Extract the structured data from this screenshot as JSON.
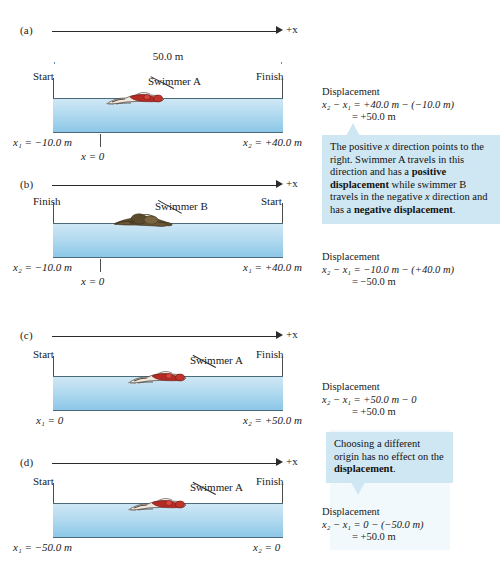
{
  "figure": {
    "axis_label": "+x",
    "distance_label": "50.0 m",
    "origin_label": "x = 0"
  },
  "panels": [
    {
      "id": "a",
      "label": "(a)",
      "axis_label": "+x",
      "dimension": "50.0 m",
      "left_end": "Start",
      "right_end": "Finish",
      "swimmer": "Swimmer A",
      "swimmer_color": "#b42a24",
      "left_coord": "x₁ = −10.0 m",
      "right_coord": "x₂ = +40.0 m",
      "origin_label": "x = 0",
      "has_origin_tick": true,
      "has_dimension": true,
      "displacement": {
        "title": "Displacement",
        "line1": "x₂ − x₁ = +40.0 m − (−10.0 m)",
        "line2": "= +50.0 m"
      }
    },
    {
      "id": "b",
      "label": "(b)",
      "axis_label": "+x",
      "dimension": "",
      "left_end": "Finish",
      "right_end": "Start",
      "swimmer": "Swimmer B",
      "swimmer_color": "#5b4a2e",
      "left_coord": "x₂ = −10.0 m",
      "right_coord": "x₁ = +40.0 m",
      "origin_label": "x = 0",
      "has_origin_tick": true,
      "has_dimension": false,
      "displacement": {
        "title": "Displacement",
        "line1": "x₂ − x₁ = −10.0 m − (+40.0 m)",
        "line2": "= −50.0 m"
      }
    },
    {
      "id": "c",
      "label": "(c)",
      "axis_label": "+x",
      "dimension": "",
      "left_end": "Start",
      "right_end": "Finish",
      "swimmer": "Swimmer A",
      "swimmer_color": "#b42a24",
      "left_coord": "x₁ = 0",
      "right_coord": "x₂ = +50.0 m",
      "origin_label": "",
      "has_origin_tick": false,
      "has_dimension": false,
      "displacement": {
        "title": "Displacement",
        "line1": "x₂ − x₁ = +50.0 m − 0",
        "line2": "= +50.0 m"
      }
    },
    {
      "id": "d",
      "label": "(d)",
      "axis_label": "+x",
      "dimension": "",
      "left_end": "Start",
      "right_end": "Finish",
      "swimmer": "Swimmer A",
      "swimmer_color": "#b42a24",
      "left_coord": "x₁ = −50.0 m",
      "right_coord": "x₂ = 0",
      "origin_label": "",
      "has_origin_tick": false,
      "has_dimension": false,
      "displacement": {
        "title": "Displacement",
        "line1": "x₂ − x₁ = 0 − (−50.0 m)",
        "line2": "= +50.0 m"
      }
    }
  ],
  "notes": [
    {
      "id": "note-direction",
      "text_plain": "The positive x direction points to the right. Swimmer A travels in this direction and has a positive displacement while swimmer B travels in the negative x direction and has a negative displacement.",
      "text_html": "The positive <i>x</i> direction points to the right. Swimmer A travels in this direction and has a <b>positive displacement</b> while swimmer B travels in the negative <i>x</i> direction and has a <b>negative displacement</b>."
    },
    {
      "id": "note-origin",
      "text_plain": "Choosing a different origin has no effect on the displacement.",
      "text_html": "Choosing a different origin has no effect on the <b>displacement</b>."
    }
  ],
  "colors": {
    "water_top": "#cfe7f5",
    "water_bottom": "#8cc7e8",
    "pool_edge": "#4c6b7a",
    "axis": "#2b2b2b",
    "dimension": "#5b8fc9",
    "note_bg": "#cfe7f3",
    "swimmer_a": "#b42a24",
    "swimmer_b": "#5b4a2e"
  }
}
